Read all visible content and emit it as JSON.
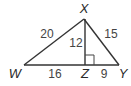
{
  "diagram": {
    "type": "right-triangle-with-altitude",
    "vertices": {
      "X": {
        "label": "X",
        "x": 84,
        "y": 19
      },
      "W": {
        "label": "W",
        "x": 24,
        "y": 65
      },
      "Z": {
        "label": "Z",
        "x": 85,
        "y": 65
      },
      "Y": {
        "label": "Y",
        "x": 119,
        "y": 65
      }
    },
    "segments": {
      "WX": {
        "label": "20"
      },
      "XY": {
        "label": "15"
      },
      "XZ": {
        "label": "12"
      },
      "WZ": {
        "label": "16"
      },
      "ZY": {
        "label": "9"
      }
    },
    "right_angle_at": "Z",
    "colors": {
      "line": "#333333",
      "text": "#444444"
    }
  }
}
